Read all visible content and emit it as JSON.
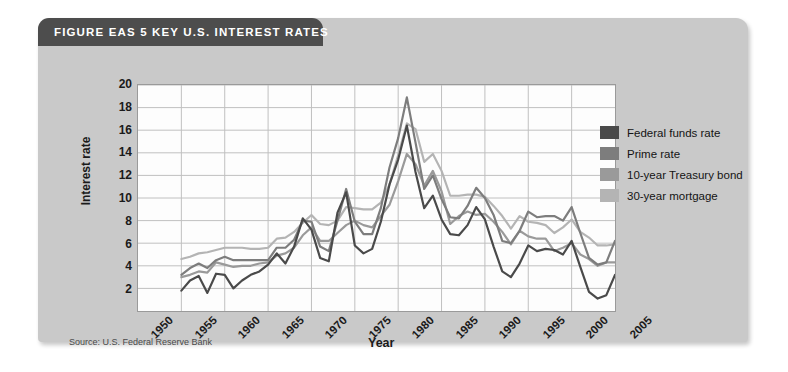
{
  "figure": {
    "title": "FIGURE EAS 5  KEY U.S. INTEREST RATES",
    "source": "Source: U.S. Federal Reserve Bank"
  },
  "colors": {
    "panel": "#c9c9c9",
    "title_bar": "#4d4d4d",
    "plot_bg": "#fdfdfd",
    "grid": "#bfbfbf",
    "federal_funds_rate": "#4a4a4a",
    "prime_rate": "#7d7d7d",
    "treasury_bond_10yr": "#9a9a9a",
    "mortgage_30yr": "#b4b4b4"
  },
  "chart_data": {
    "type": "line",
    "title": "KEY U.S. INTEREST RATES",
    "xlabel": "Year",
    "ylabel": "Interest rate",
    "xlim": [
      1950,
      2005
    ],
    "ylim": [
      0,
      20
    ],
    "xticks": [
      1950,
      1955,
      1960,
      1965,
      1970,
      1975,
      1980,
      1985,
      1990,
      1995,
      2000,
      2005
    ],
    "yticks": [
      2,
      4,
      6,
      8,
      10,
      12,
      14,
      16,
      18,
      20
    ],
    "grid": true,
    "legend_position": "right",
    "x": [
      1955,
      1956,
      1957,
      1958,
      1959,
      1960,
      1961,
      1962,
      1963,
      1964,
      1965,
      1966,
      1967,
      1968,
      1969,
      1970,
      1971,
      1972,
      1973,
      1974,
      1975,
      1976,
      1977,
      1978,
      1979,
      1980,
      1981,
      1982,
      1983,
      1984,
      1985,
      1986,
      1987,
      1988,
      1989,
      1990,
      1991,
      1992,
      1993,
      1994,
      1995,
      1996,
      1997,
      1998,
      1999,
      2000,
      2001,
      2002,
      2003,
      2004,
      2005
    ],
    "series": [
      {
        "name": "Federal funds rate",
        "color": "#4a4a4a",
        "values": [
          1.8,
          2.7,
          3.1,
          1.6,
          3.3,
          3.2,
          2.0,
          2.7,
          3.2,
          3.5,
          4.1,
          5.1,
          4.2,
          5.7,
          8.2,
          7.2,
          4.7,
          4.4,
          8.7,
          10.5,
          5.8,
          5.1,
          5.5,
          7.9,
          11.2,
          13.4,
          16.4,
          12.3,
          9.1,
          10.2,
          8.1,
          6.8,
          6.7,
          7.6,
          9.2,
          8.1,
          5.7,
          3.5,
          3.0,
          4.2,
          5.8,
          5.3,
          5.5,
          5.4,
          5.0,
          6.2,
          3.9,
          1.7,
          1.1,
          1.4,
          3.2
        ]
      },
      {
        "name": "Prime rate",
        "color": "#7d7d7d",
        "values": [
          3.2,
          3.8,
          4.2,
          3.8,
          4.5,
          4.8,
          4.5,
          4.5,
          4.5,
          4.5,
          4.5,
          5.6,
          5.6,
          6.3,
          8.0,
          7.9,
          5.7,
          5.3,
          8.0,
          10.8,
          7.9,
          6.8,
          6.8,
          9.1,
          12.7,
          15.3,
          18.9,
          14.9,
          10.8,
          12.0,
          9.9,
          8.3,
          8.2,
          9.3,
          10.9,
          10.0,
          8.5,
          6.2,
          6.0,
          7.1,
          8.8,
          8.3,
          8.4,
          8.4,
          8.0,
          9.2,
          6.9,
          4.7,
          4.1,
          4.3,
          6.2
        ]
      },
      {
        "name": "10-year Treasury bond",
        "color": "#9a9a9a",
        "values": [
          3.0,
          3.2,
          3.5,
          3.4,
          4.3,
          4.1,
          3.9,
          4.0,
          4.0,
          4.2,
          4.3,
          4.9,
          5.1,
          5.6,
          6.7,
          7.4,
          6.2,
          6.2,
          6.9,
          7.6,
          8.0,
          7.6,
          7.4,
          8.4,
          9.4,
          11.5,
          13.9,
          13.0,
          11.1,
          12.4,
          10.6,
          7.7,
          8.4,
          8.8,
          8.5,
          8.6,
          7.9,
          7.0,
          5.9,
          7.1,
          6.6,
          6.4,
          6.4,
          5.3,
          5.6,
          6.0,
          5.0,
          4.6,
          4.0,
          4.3,
          4.3
        ]
      },
      {
        "name": "30-year mortgage",
        "color": "#b4b4b4",
        "values": [
          4.6,
          4.8,
          5.1,
          5.2,
          5.4,
          5.6,
          5.6,
          5.6,
          5.5,
          5.5,
          5.6,
          6.4,
          6.5,
          7.0,
          7.8,
          8.5,
          7.7,
          7.6,
          8.0,
          9.2,
          9.1,
          9.0,
          9.0,
          9.6,
          11.2,
          13.8,
          16.6,
          16.1,
          13.2,
          13.9,
          12.4,
          10.2,
          10.2,
          10.3,
          10.3,
          10.1,
          9.3,
          8.4,
          7.3,
          8.4,
          7.9,
          7.8,
          7.6,
          6.9,
          7.4,
          8.1,
          7.0,
          6.5,
          5.8,
          5.8,
          5.9
        ]
      }
    ]
  },
  "legend": {
    "items": [
      {
        "label": "Federal funds rate",
        "color": "#4a4a4a"
      },
      {
        "label": "Prime rate",
        "color": "#7d7d7d"
      },
      {
        "label": "10-year Treasury bond",
        "color": "#9a9a9a"
      },
      {
        "label": "30-year mortgage",
        "color": "#b4b4b4"
      }
    ]
  }
}
